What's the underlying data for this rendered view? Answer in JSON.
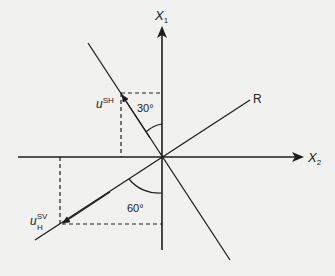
{
  "diagram": {
    "colors": {
      "background": "#f1f1ef",
      "ink": "#1e1e1e"
    },
    "axes": {
      "vertical": {
        "label": "X",
        "subscript": "1"
      },
      "horizontal": {
        "label": "X",
        "subscript": "2"
      }
    },
    "lines": {
      "ray": {
        "label": "R"
      }
    },
    "vectors": {
      "sh": {
        "base": "u",
        "superscript": "SH",
        "subscript": ""
      },
      "sv": {
        "base": "u",
        "superscript": "SV",
        "subscript": "H"
      }
    },
    "angles": {
      "upper": "30°",
      "lower": "60°"
    }
  }
}
